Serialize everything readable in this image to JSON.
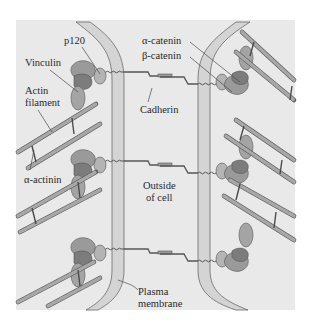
{
  "figure": {
    "colors": {
      "panel": "#e9e9e9",
      "membrane_fill": "#d2d2d2",
      "membrane_edge": "#6a6a6a",
      "protein": "#9a9a9a",
      "protein_dark": "#7c7c7c",
      "filament": "#8a8a8a",
      "line": "#4a4a4a",
      "text": "#2a2a2a"
    }
  },
  "labels": {
    "p120": "p120",
    "vinculin": "Vinculin",
    "actin_line1": "Actin",
    "actin_line2": "filament",
    "alpha_actinin": "α-actinin",
    "alpha_catenin": "α-catenin",
    "beta_catenin": "β-catenin",
    "cadherin": "Cadherin",
    "outside_line1": "Outside",
    "outside_line2": "of cell",
    "plasma_line1": "Plasma",
    "plasma_line2": "membrane"
  },
  "junctions": [
    {
      "name": "junction-top"
    },
    {
      "name": "junction-middle"
    },
    {
      "name": "junction-bottom"
    }
  ]
}
